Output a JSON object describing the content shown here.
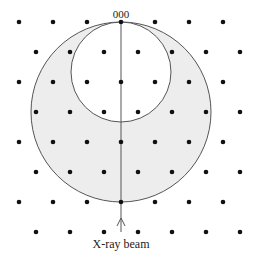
{
  "diagram": {
    "origin_label": "000",
    "beam_label": "X-ray beam",
    "colors": {
      "background": "#ffffff",
      "ewald_fill": "#ededed",
      "line": "#555555",
      "point": "#111111"
    },
    "ewald_circle": {
      "cx": 121,
      "cy": 112,
      "r": 90
    },
    "limiting_inner_circle": {
      "cx": 121,
      "cy": 72,
      "r": 50
    },
    "beam_line": {
      "x": 121,
      "y1": 22,
      "y2": 232
    },
    "lattice": {
      "rows_y": [
        22,
        52,
        82,
        112,
        142,
        172,
        202,
        232
      ],
      "even_row_x": [
        19,
        53,
        87,
        121,
        155,
        189,
        223
      ],
      "odd_row_x": [
        36,
        70,
        104,
        138,
        172,
        206,
        240
      ],
      "point_radius": 2.3
    }
  }
}
